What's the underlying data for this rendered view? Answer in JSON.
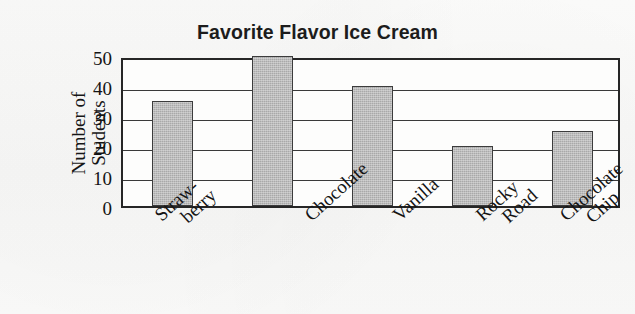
{
  "chart_data": {
    "type": "bar",
    "title": "Favorite Flavor Ice Cream",
    "xlabel": "",
    "ylabel": "Number of Students",
    "ylabel_lines": [
      "Number of",
      "Students"
    ],
    "categories": [
      "Straw-berry",
      "Chocolate",
      "Vanilla",
      "Rocky Road",
      "Chocolate Chip"
    ],
    "category_lines": [
      [
        "Straw-",
        "berry"
      ],
      [
        "Chocolate",
        ""
      ],
      [
        "Vanilla",
        ""
      ],
      [
        "Rocky",
        "Road"
      ],
      [
        "Chocolate",
        "Chip"
      ]
    ],
    "values": [
      35,
      50,
      40,
      20,
      25
    ],
    "ylim": [
      0,
      50
    ],
    "yticks": [
      0,
      10,
      20,
      30,
      40,
      50
    ],
    "ytick_labels": [
      "0",
      "10",
      "20",
      "30",
      "40",
      "50"
    ],
    "grid": true,
    "legend": false,
    "bar_fill_color": "#a9a9a9",
    "bar_border_color": "#3c3c3c",
    "axis_color": "#262626",
    "background_color": "#f9f9f8"
  }
}
